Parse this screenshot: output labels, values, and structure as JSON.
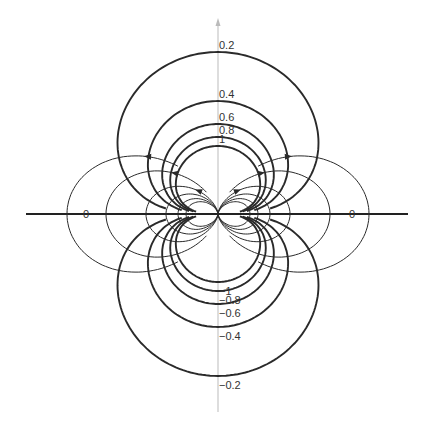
{
  "diagram": {
    "type": "dipole-field",
    "origin": {
      "x": 218,
      "y": 214
    },
    "axes": {
      "horizontal": {
        "x1": 26,
        "x2": 408,
        "y": 214,
        "color": "#222222"
      },
      "vertical": {
        "x": 218,
        "y1": 18,
        "y2": 412,
        "color": "#bbbbbb",
        "arrow": "up"
      }
    },
    "colors": {
      "equipotential": "#2a2a2a",
      "field_line": "#2a2a2a",
      "label": "#333333"
    },
    "equipotentials": [
      {
        "value": 0.2,
        "label": "0.2",
        "top_radius": 162
      },
      {
        "value": 0.4,
        "label": "0.4",
        "top_radius": 113
      },
      {
        "value": 0.6,
        "label": "0.6",
        "top_radius": 90
      },
      {
        "value": 0.8,
        "label": "0.8",
        "top_radius": 77
      },
      {
        "value": 1,
        "label": "1",
        "top_radius": 68
      },
      {
        "value": -0.2,
        "label": "−0.2",
        "top_radius": 162
      },
      {
        "value": -0.4,
        "label": "−0.4",
        "top_radius": 113
      },
      {
        "value": -0.6,
        "label": "−0.6",
        "top_radius": 90
      },
      {
        "value": -0.8,
        "label": "−0.8",
        "top_radius": 77
      },
      {
        "value": -1,
        "label": "−1",
        "top_radius": 68
      }
    ],
    "field_lines": [
      {
        "axis_crossing": 151,
        "arrow": true,
        "theta_min": 40
      },
      {
        "axis_crossing": 112,
        "arrow": true,
        "theta_min": 28
      },
      {
        "axis_crossing": 72,
        "arrow": true,
        "theta_min": 10
      },
      {
        "axis_crossing": 52,
        "arrow": false,
        "theta_min": 5
      },
      {
        "axis_crossing": 40,
        "arrow": false,
        "theta_min": 5
      },
      {
        "axis_crossing": 32,
        "arrow": false,
        "theta_min": 5
      }
    ],
    "zero_labels": [
      {
        "label": "0",
        "x": 83,
        "y": 218
      },
      {
        "label": "0",
        "x": 349,
        "y": 218
      }
    ]
  }
}
